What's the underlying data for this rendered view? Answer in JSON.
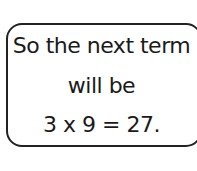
{
  "note": {
    "lines": [
      "So the next term",
      "will be",
      "3 x 9 = 27."
    ]
  }
}
